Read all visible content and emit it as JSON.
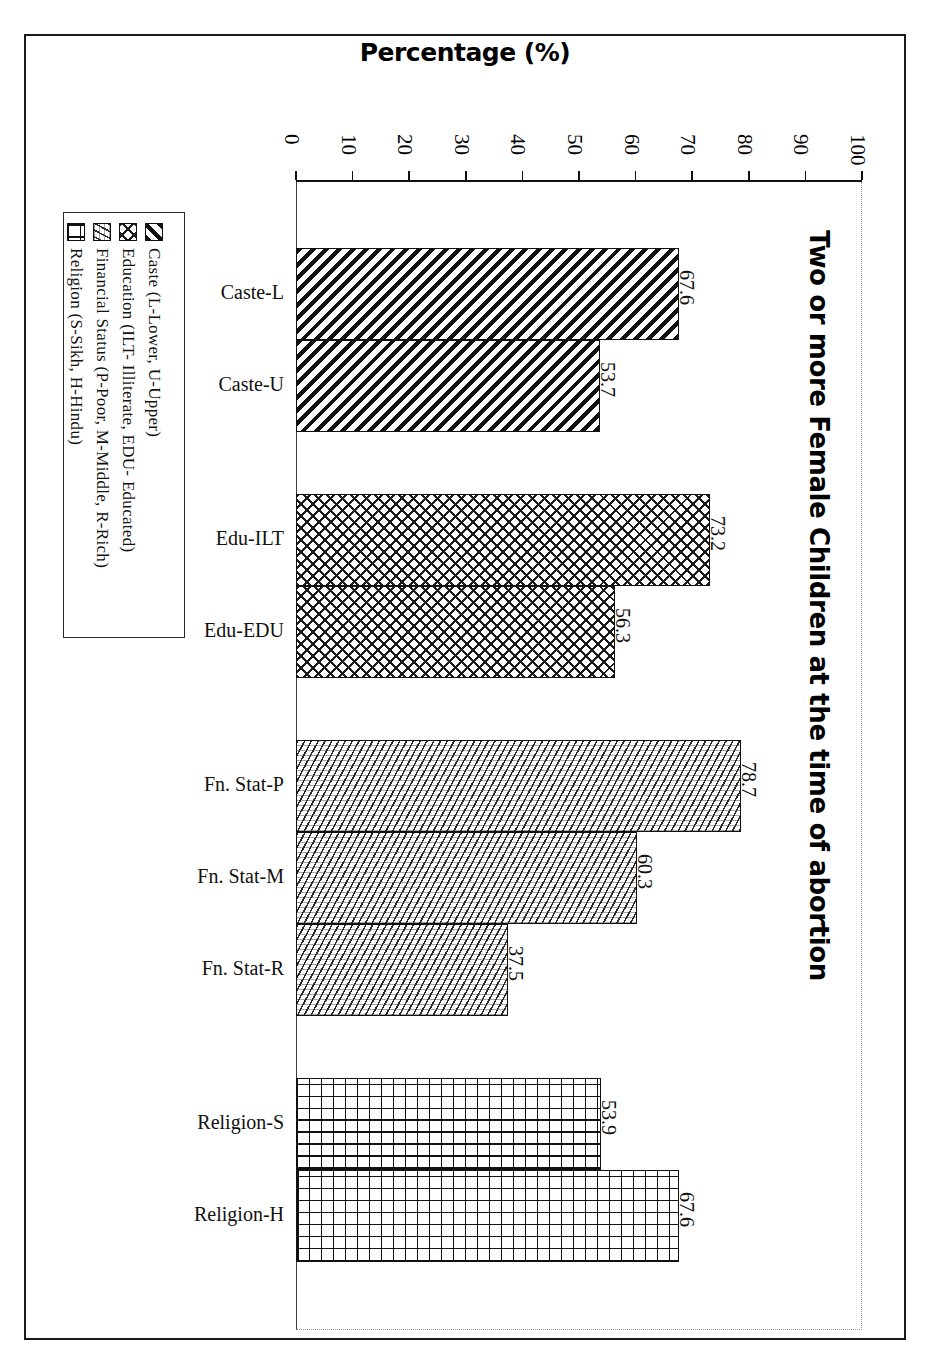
{
  "axis_title": "Percentage (%)",
  "chart_title": "Two or more Female Children at the time of abortion",
  "legend": {
    "items": [
      {
        "label": "Caste (L-Lower, U-Upper)",
        "swatch": "diagonal-hatch-swatch"
      },
      {
        "label": "Education (ILT- Illiterate, EDU- Educated)",
        "swatch": "crosshatch-swatch"
      },
      {
        "label": "Financial Status (P-Poor, M-Middle, R-Rich)",
        "swatch": "fine-diagonal-swatch"
      },
      {
        "label": "Religion (S-Sikh, H-Hindu)",
        "swatch": "grid-swatch"
      }
    ]
  },
  "chart_data": {
    "type": "bar",
    "orientation": "horizontal",
    "title": "Two or more Female Children at the time of abortion",
    "xlabel": "Percentage (%)",
    "ylabel": "",
    "xlim": [
      0,
      100
    ],
    "grid": false,
    "legend_position": "left",
    "tick_labels": [
      "0",
      "10",
      "20",
      "30",
      "40",
      "50",
      "60",
      "70",
      "80",
      "90",
      "100"
    ],
    "tick_values": [
      0,
      10,
      20,
      30,
      40,
      50,
      60,
      70,
      80,
      90,
      100
    ],
    "categories": [
      "Caste-L",
      "Caste-U",
      "Edu-ILT",
      "Edu-EDU",
      "Fn. Stat-P",
      "Fn. Stat-M",
      "Fn. Stat-R",
      "Religion-S",
      "Religion-H"
    ],
    "values": [
      67.6,
      53.7,
      73.2,
      56.3,
      78.7,
      60.3,
      37.5,
      53.9,
      67.6
    ],
    "groups": [
      {
        "name": "Caste",
        "pattern": "pat-caste",
        "bars": [
          {
            "label": "Caste-L",
            "value": 67.6
          },
          {
            "label": "Caste-U",
            "value": 53.7
          }
        ]
      },
      {
        "name": "Education",
        "pattern": "pat-edu",
        "bars": [
          {
            "label": "Edu-ILT",
            "value": 73.2
          },
          {
            "label": "Edu-EDU",
            "value": 56.3
          }
        ]
      },
      {
        "name": "Financial Status",
        "pattern": "pat-fin",
        "bars": [
          {
            "label": "Fn. Stat-P",
            "value": 78.7
          },
          {
            "label": "Fn. Stat-M",
            "value": 60.3
          },
          {
            "label": "Fn. Stat-R",
            "value": 37.5
          }
        ]
      },
      {
        "name": "Religion",
        "pattern": "pat-rel",
        "bars": [
          {
            "label": "Religion-S",
            "value": 53.9
          },
          {
            "label": "Religion-H",
            "value": 67.6
          }
        ]
      }
    ]
  }
}
